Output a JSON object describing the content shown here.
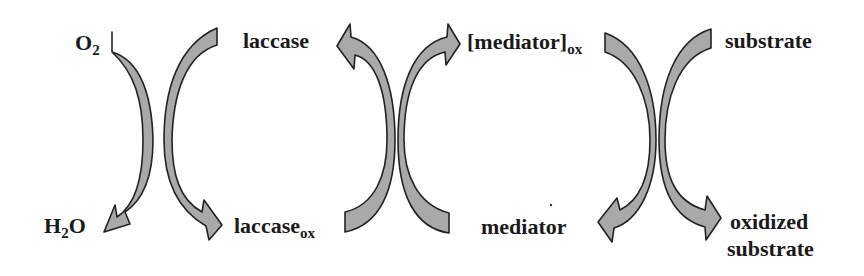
{
  "diagram": {
    "colors": {
      "arrow_fill": "#a9a9a9",
      "arrow_stroke": "#222222",
      "text": "#1a1a1a",
      "background": "#ffffff"
    },
    "labels": {
      "o2": {
        "main": "O",
        "sub": "2"
      },
      "h2o": {
        "pre": "H",
        "sub": "2",
        "post": "O"
      },
      "laccase": "laccase",
      "laccase_ox": {
        "main": "laccase",
        "sub": "ox"
      },
      "mediator_ox": {
        "main": "[mediator]",
        "sub": "ox"
      },
      "mediator": "mediator",
      "substrate": "substrate",
      "oxidized_substrate_line1": "oxidized",
      "oxidized_substrate_line2": "substrate"
    },
    "cycles": [
      {
        "name": "oxygen-laccase cycle",
        "left_from": "O2",
        "left_to": "H2O",
        "right_from": "laccase",
        "right_to": "laccase_ox"
      },
      {
        "name": "laccase-mediator cycle",
        "left_from": "laccase_ox",
        "left_to": "laccase",
        "right_from": "mediator",
        "right_to": "[mediator]_ox"
      },
      {
        "name": "mediator-substrate cycle",
        "left_from": "[mediator]_ox",
        "left_to": "mediator",
        "right_from": "substrate",
        "right_to": "oxidized substrate"
      }
    ]
  }
}
